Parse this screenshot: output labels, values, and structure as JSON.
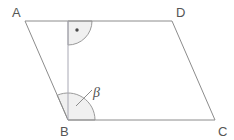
{
  "figure": {
    "shape_type": "parallelogram",
    "vertices": [
      {
        "name": "A",
        "label": "A",
        "x": 25,
        "y": 21,
        "label_x": 12,
        "label_y": 17
      },
      {
        "name": "D",
        "label": "D",
        "x": 172,
        "y": 21,
        "label_x": 176,
        "label_y": 17
      },
      {
        "name": "B",
        "label": "B",
        "x": 68,
        "y": 120,
        "label_x": 60,
        "label_y": 136
      },
      {
        "name": "C",
        "label": "C",
        "x": 215,
        "y": 120,
        "label_x": 218,
        "label_y": 136
      }
    ],
    "edges": [
      {
        "name": "edge-AD",
        "from": "A",
        "to": "D"
      },
      {
        "name": "edge-DC",
        "from": "D",
        "to": "C"
      },
      {
        "name": "edge-CB",
        "from": "C",
        "to": "B"
      },
      {
        "name": "edge-BA",
        "from": "B",
        "to": "A"
      }
    ],
    "altitude": {
      "name": "altitude-foot-to-B",
      "from_x": 68,
      "from_y": 21,
      "to_x": 68,
      "to_y": 120
    },
    "angles": [
      {
        "name": "right-angle-at-foot",
        "label": "",
        "marker": "right-angle-dot",
        "vertex_x": 68,
        "vertex_y": 21,
        "radius": 24,
        "dot_x": 77,
        "dot_y": 30
      },
      {
        "name": "angle-beta-at-B",
        "label": "β",
        "marker": "arc",
        "vertex_x": 68,
        "vertex_y": 120,
        "radius": 27,
        "label_x": 93,
        "label_y": 97
      }
    ],
    "leader": {
      "name": "beta-leader-line",
      "x1": 76,
      "y1": 106,
      "x2": 92,
      "y2": 90
    },
    "colors": {
      "edge_stroke": "#8c8c8c",
      "altitude_stroke": "#a8a8b4",
      "arc_fill": "#f0f0f0",
      "arc_stroke": "#9a9a9a",
      "label_text": "#555555",
      "background": "#ffffff",
      "dot": "#4a4a4a"
    }
  }
}
